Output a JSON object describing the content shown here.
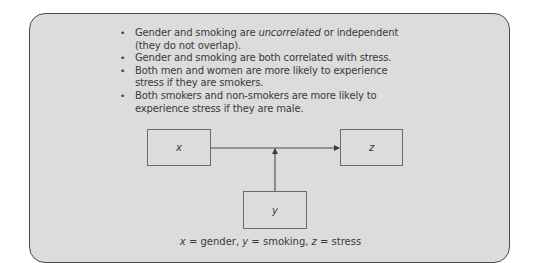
{
  "bullets": [
    {
      "before": "Gender and smoking are ",
      "emph": "uncorrelated",
      "after": " or independent (they do not overlap)."
    },
    {
      "before": "Gender and smoking are both correlated with stress.",
      "emph": "",
      "after": ""
    },
    {
      "before": "Both men and women are more likely to experience stress if they are smokers.",
      "emph": "",
      "after": ""
    },
    {
      "before": "Both smokers and non-smokers are more likely to experience stress if they are male.",
      "emph": "",
      "after": ""
    }
  ],
  "bullet_glyph": "•",
  "diagram": {
    "nodes": {
      "x": "x",
      "y": "y",
      "z": "z"
    },
    "edges": [
      {
        "from": "x",
        "to": "z",
        "type": "arrow"
      },
      {
        "from": "y",
        "to": "x→z edge",
        "type": "arrow (moderator)"
      }
    ]
  },
  "caption": {
    "x_var": "x",
    "x_eq": " = gender, ",
    "y_var": "y",
    "y_eq": " = smoking, ",
    "z_var": "z",
    "z_eq": " = stress"
  },
  "colors": {
    "panel_bg": "#dcdcdc",
    "panel_border": "#4a4a4a",
    "text": "#3a3a3a",
    "line": "#4a4a4a"
  }
}
